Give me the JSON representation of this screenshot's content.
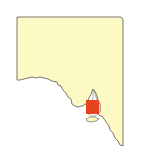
{
  "map": {
    "region": "South Australia",
    "land_color": "#fdf9c4",
    "outline_color": "#7a7a6a",
    "water_color": "#ffffff",
    "highlight": {
      "label": "highlighted area",
      "color": "#e8431f"
    }
  }
}
